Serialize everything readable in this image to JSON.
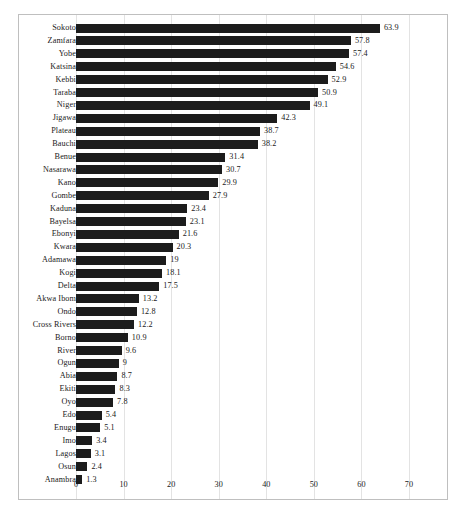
{
  "chart_data": {
    "type": "bar",
    "orientation": "horizontal",
    "title": "",
    "subtitle": "",
    "xlabel": "",
    "ylabel": "",
    "xlim": [
      0,
      70
    ],
    "xticks": [
      "0",
      "10",
      "20",
      "30",
      "40",
      "50",
      "60",
      "70"
    ],
    "grid": true,
    "grid_axis": "x",
    "legend": false,
    "legend_position": "none",
    "bar_color": "#1c1c1c",
    "frame_color": "#bfbfbf",
    "gridline_color": "#e3e3e3",
    "text_color": "#1a1a1a",
    "show_data_labels": true,
    "categories": [
      "Sokoto",
      "Zamfara",
      "Yobe",
      "Katsina",
      "Kebbi",
      "Taraba",
      "Niger",
      "Jigawa",
      "Plateau",
      "Bauchi",
      "Benue",
      "Nasarawa",
      "Kano",
      "Gombe",
      "Kaduna",
      "Bayelsa",
      "Ebonyi",
      "Kwara",
      "Adamawa",
      "Kogi",
      "Delta",
      "Akwa Ibom",
      "Ondo",
      "Cross Rivers",
      "Borno",
      "River",
      "Ogun",
      "Abia",
      "Ekiti",
      "Oyo",
      "Edo",
      "Enugu",
      "Imo",
      "Lagos",
      "Osun",
      "Anambra"
    ],
    "values": [
      63.9,
      57.8,
      57.4,
      54.6,
      52.9,
      50.9,
      49.1,
      42.3,
      38.7,
      38.2,
      31.4,
      30.7,
      29.9,
      27.9,
      23.4,
      23.1,
      21.6,
      20.3,
      19,
      18.1,
      17.5,
      13.2,
      12.8,
      12.2,
      10.9,
      9.6,
      9,
      8.7,
      8.3,
      7.8,
      5.4,
      5.1,
      3.4,
      3.1,
      2.4,
      1.3
    ],
    "value_labels": [
      "63.9",
      "57.8",
      "57.4",
      "54.6",
      "52.9",
      "50.9",
      "49.1",
      "42.3",
      "38.7",
      "38.2",
      "31.4",
      "30.7",
      "29.9",
      "27.9",
      "23.4",
      "23.1",
      "21.6",
      "20.3",
      "19",
      "18.1",
      "17.5",
      "13.2",
      "12.8",
      "12.2",
      "10.9",
      "9.6",
      "9",
      "8.7",
      "8.3",
      "7.8",
      "5.4",
      "5.1",
      "3.4",
      "3.1",
      "2.4",
      "1.3"
    ]
  }
}
